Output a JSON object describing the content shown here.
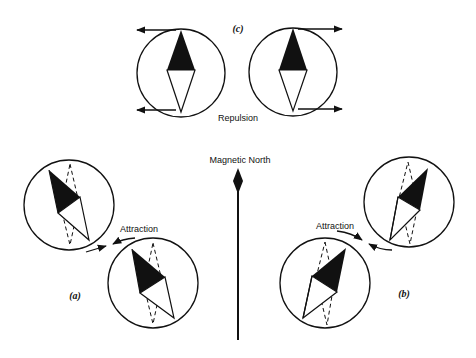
{
  "figure": {
    "panels": {
      "c": {
        "label": "(c)",
        "caption": "Repulsion"
      },
      "a": {
        "label": "(a)",
        "caption": "Attraction"
      },
      "b": {
        "label": "(b)",
        "caption": "Attraction"
      }
    },
    "center_arrow": {
      "label": "Magnetic North"
    }
  },
  "colors": {
    "ink": "#111111",
    "background": "#ffffff"
  }
}
